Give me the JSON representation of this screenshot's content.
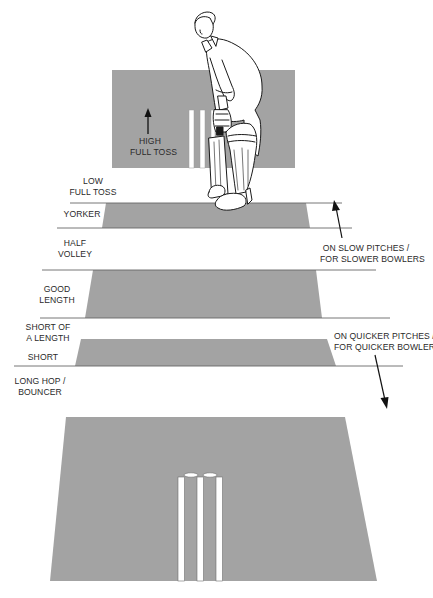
{
  "diagram": {
    "colors": {
      "pitch": "#a3a3a3",
      "line": "#555555",
      "stroke": "#1a1a1a",
      "background": "#ffffff"
    },
    "top_label": {
      "line1": "HIGH",
      "line2": "FULL TOSS"
    },
    "length_labels": [
      {
        "id": "low-full-toss",
        "line1": "LOW",
        "line2": "FULL TOSS"
      },
      {
        "id": "yorker",
        "line1": "YORKER",
        "line2": ""
      },
      {
        "id": "half-volley",
        "line1": "HALF",
        "line2": "VOLLEY"
      },
      {
        "id": "good-length",
        "line1": "GOOD",
        "line2": "LENGTH"
      },
      {
        "id": "short-of-a-length",
        "line1": "SHORT OF",
        "line2": "A LENGTH"
      },
      {
        "id": "short",
        "line1": "SHORT",
        "line2": ""
      },
      {
        "id": "long-hop-bouncer",
        "line1": "LONG HOP /",
        "line2": "BOUNCER"
      }
    ],
    "annotations": {
      "slow": {
        "line1": "ON SLOW PITCHES /",
        "line2": "FOR SLOWER BOWLERS",
        "arrow": "arrow-up"
      },
      "quick": {
        "line1": "ON QUICKER PITCHES /",
        "line2": "FOR QUICKER BOWLERS",
        "arrow": "arrow-down"
      }
    },
    "icons": {
      "batter": "batter-figure",
      "stumps_near": "stumps",
      "stumps_far": "stumps"
    }
  }
}
